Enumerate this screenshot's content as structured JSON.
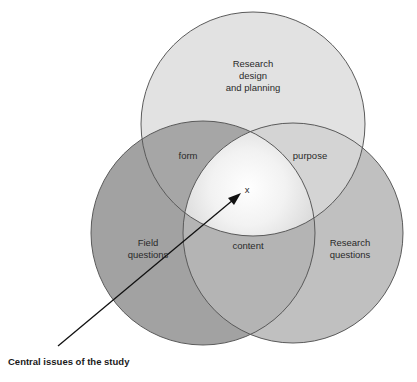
{
  "diagram": {
    "type": "venn",
    "circles": [
      {
        "id": "top",
        "label": "Research design and planning",
        "lines": [
          "Research",
          "design",
          "and planning"
        ],
        "fill": "#e3e3e3"
      },
      {
        "id": "left",
        "label": "Field questions",
        "lines": [
          "Field",
          "questions"
        ],
        "fill": "#a3a3a3"
      },
      {
        "id": "right",
        "label": "Research questions",
        "lines": [
          "Research",
          "questions"
        ],
        "fill": "#c2c2c2"
      }
    ],
    "intersections": {
      "top_left": "form",
      "top_right": "purpose",
      "left_right": "content",
      "center": "x"
    },
    "arrow": {
      "label": "Central issues of the study",
      "color": "#000000"
    },
    "stroke_color": "#555555"
  }
}
